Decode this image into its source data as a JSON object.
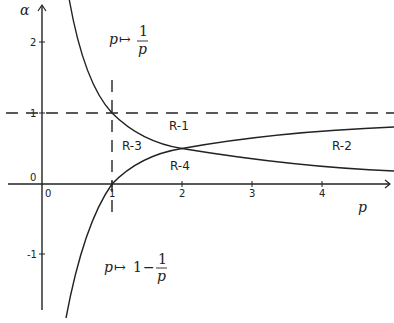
{
  "axes": {
    "x_label": "p",
    "y_label": "α",
    "x_ticks": [
      "0",
      "1",
      "2",
      "3",
      "4"
    ],
    "y_ticks": [
      "2",
      "1",
      "0",
      "-1"
    ]
  },
  "curves": {
    "reciprocal": {
      "label_var": "p",
      "label_arrow": "↦",
      "label_num": "1",
      "label_den": "p"
    },
    "one_minus_reciprocal": {
      "label_var": "p",
      "label_arrow": "↦",
      "label_one": "1",
      "label_minus": "−",
      "label_num": "1",
      "label_den": "p"
    }
  },
  "regions": [
    "R-1",
    "R-2",
    "R-3",
    "R-4"
  ],
  "colors": {
    "ink": "#222222",
    "background": "#ffffff"
  }
}
